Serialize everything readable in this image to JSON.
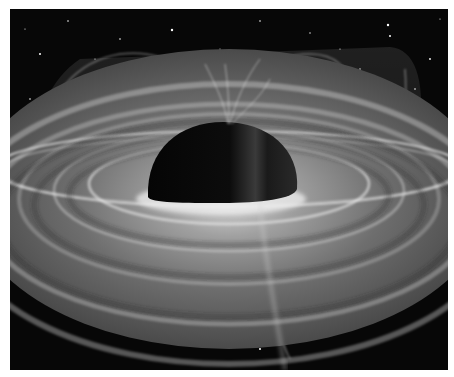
{
  "image": {
    "subject": "black hole with accretion disk and magnetic field lines",
    "style": "grayscale illustration",
    "colors": {
      "space": "#070707",
      "disk": "#8a8a8a",
      "disk_highlight": "#e6e6e6",
      "event_horizon": "#0a0a0a",
      "border": "#ffffff"
    }
  }
}
